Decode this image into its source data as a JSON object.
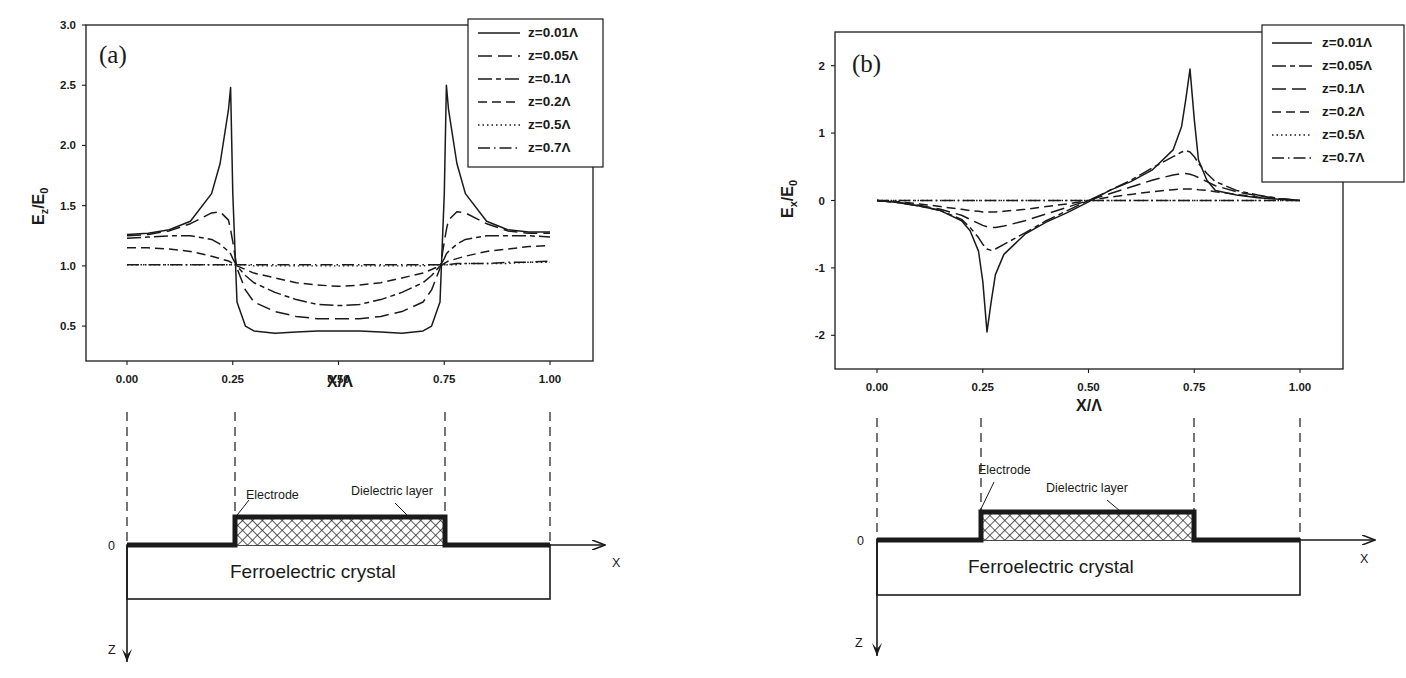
{
  "figure": {
    "panels": [
      "(a)",
      "(b)"
    ],
    "diagram": {
      "electrode_label": "Electrode",
      "dielectric_label": "Dielectric layer",
      "crystal_label": "Ferroelectric crystal",
      "origin_label": "0",
      "x_axis_label": "X",
      "z_axis_label": "Z"
    }
  },
  "chart_data": [
    {
      "type": "line",
      "panel": "(a)",
      "title": "",
      "xlabel": "X/Λ",
      "ylabel": "E_z/E_0",
      "xlim": [
        -0.1,
        1.11
      ],
      "ylim": [
        0.21,
        3.0
      ],
      "xticks": [
        "0.00",
        "0.25",
        "0.50",
        "0.75",
        "1.00"
      ],
      "yticks": [
        "0.5",
        "1.0",
        "1.5",
        "2.0",
        "2.5",
        "3.0"
      ],
      "grid": false,
      "legend_position": "top-right",
      "x": [
        0.0,
        0.05,
        0.1,
        0.15,
        0.2,
        0.22,
        0.24,
        0.245,
        0.25,
        0.26,
        0.28,
        0.3,
        0.35,
        0.4,
        0.45,
        0.5,
        0.55,
        0.6,
        0.65,
        0.7,
        0.72,
        0.74,
        0.75,
        0.755,
        0.76,
        0.78,
        0.8,
        0.85,
        0.9,
        0.95,
        1.0
      ],
      "series": [
        {
          "name": "z=0.01Λ",
          "dash": "solid",
          "values": [
            1.26,
            1.27,
            1.3,
            1.37,
            1.6,
            1.85,
            2.3,
            2.48,
            1.6,
            0.7,
            0.5,
            0.46,
            0.44,
            0.45,
            0.46,
            0.46,
            0.46,
            0.45,
            0.44,
            0.46,
            0.5,
            0.7,
            1.6,
            2.5,
            2.3,
            1.85,
            1.6,
            1.37,
            1.3,
            1.28,
            1.28
          ]
        },
        {
          "name": "z=0.05Λ",
          "dash": "long",
          "values": [
            1.25,
            1.26,
            1.29,
            1.35,
            1.44,
            1.45,
            1.38,
            1.3,
            1.2,
            0.98,
            0.8,
            0.7,
            0.62,
            0.58,
            0.56,
            0.56,
            0.56,
            0.58,
            0.62,
            0.7,
            0.8,
            0.98,
            1.2,
            1.3,
            1.38,
            1.45,
            1.44,
            1.35,
            1.29,
            1.27,
            1.27
          ]
        },
        {
          "name": "z=0.1Λ",
          "dash": "longshort",
          "values": [
            1.23,
            1.24,
            1.25,
            1.25,
            1.22,
            1.18,
            1.12,
            1.1,
            1.06,
            1.0,
            0.92,
            0.86,
            0.78,
            0.72,
            0.68,
            0.67,
            0.68,
            0.72,
            0.78,
            0.86,
            0.92,
            1.0,
            1.06,
            1.1,
            1.12,
            1.18,
            1.22,
            1.25,
            1.25,
            1.25,
            1.24
          ]
        },
        {
          "name": "z=0.2Λ",
          "dash": "medium",
          "values": [
            1.15,
            1.15,
            1.14,
            1.12,
            1.08,
            1.06,
            1.04,
            1.03,
            1.02,
            1.0,
            0.97,
            0.94,
            0.9,
            0.86,
            0.84,
            0.83,
            0.84,
            0.86,
            0.9,
            0.94,
            0.97,
            1.0,
            1.02,
            1.03,
            1.04,
            1.06,
            1.08,
            1.12,
            1.14,
            1.16,
            1.17
          ]
        },
        {
          "name": "z=0.5Λ",
          "dash": "dotted",
          "values": [
            1.01,
            1.01,
            1.01,
            1.01,
            1.01,
            1.01,
            1.01,
            1.01,
            1.01,
            1.01,
            1.01,
            1.0,
            1.0,
            1.0,
            1.0,
            1.0,
            1.0,
            1.0,
            1.0,
            1.0,
            1.01,
            1.01,
            1.01,
            1.01,
            1.01,
            1.01,
            1.02,
            1.02,
            1.02,
            1.03,
            1.03
          ]
        },
        {
          "name": "z=0.7Λ",
          "dash": "dashdot",
          "values": [
            1.01,
            1.01,
            1.01,
            1.01,
            1.01,
            1.01,
            1.01,
            1.01,
            1.01,
            1.01,
            1.01,
            1.01,
            1.01,
            1.01,
            1.01,
            1.01,
            1.01,
            1.01,
            1.01,
            1.01,
            1.01,
            1.01,
            1.01,
            1.01,
            1.01,
            1.02,
            1.02,
            1.02,
            1.03,
            1.03,
            1.04
          ]
        }
      ]
    },
    {
      "type": "line",
      "panel": "(b)",
      "title": "",
      "xlabel": "X/Λ",
      "ylabel": "E_x/E_0",
      "xlim": [
        -0.12,
        1.11
      ],
      "ylim": [
        -2.5,
        2.5
      ],
      "xticks": [
        "0.00",
        "0.25",
        "0.50",
        "0.75",
        "1.00"
      ],
      "yticks": [
        "-2",
        "-1",
        "0",
        "1",
        "2"
      ],
      "grid": false,
      "legend_position": "top-right (outside)",
      "x": [
        0.0,
        0.05,
        0.1,
        0.15,
        0.2,
        0.22,
        0.24,
        0.25,
        0.26,
        0.27,
        0.28,
        0.3,
        0.35,
        0.4,
        0.45,
        0.5,
        0.55,
        0.6,
        0.65,
        0.7,
        0.72,
        0.73,
        0.74,
        0.75,
        0.76,
        0.78,
        0.8,
        0.85,
        0.9,
        0.95,
        1.0
      ],
      "series": [
        {
          "name": "z=0.01Λ",
          "dash": "solid",
          "values": [
            0.0,
            -0.03,
            -0.08,
            -0.15,
            -0.3,
            -0.45,
            -0.75,
            -1.2,
            -1.95,
            -1.5,
            -1.1,
            -0.8,
            -0.5,
            -0.32,
            -0.18,
            -0.02,
            0.15,
            0.28,
            0.45,
            0.75,
            1.1,
            1.5,
            1.95,
            1.2,
            0.6,
            0.3,
            0.15,
            0.08,
            0.04,
            0.02,
            0.0
          ]
        },
        {
          "name": "z=0.05Λ",
          "dash": "longshort",
          "values": [
            0.0,
            -0.03,
            -0.08,
            -0.15,
            -0.28,
            -0.4,
            -0.55,
            -0.65,
            -0.72,
            -0.74,
            -0.72,
            -0.65,
            -0.48,
            -0.3,
            -0.15,
            0.0,
            0.15,
            0.3,
            0.48,
            0.65,
            0.72,
            0.74,
            0.72,
            0.65,
            0.55,
            0.4,
            0.28,
            0.15,
            0.08,
            0.03,
            0.0
          ]
        },
        {
          "name": "z=0.1Λ",
          "dash": "long",
          "values": [
            0.0,
            -0.03,
            -0.07,
            -0.13,
            -0.22,
            -0.28,
            -0.34,
            -0.37,
            -0.39,
            -0.4,
            -0.4,
            -0.38,
            -0.3,
            -0.2,
            -0.1,
            0.0,
            0.1,
            0.2,
            0.3,
            0.38,
            0.4,
            0.4,
            0.39,
            0.37,
            0.34,
            0.28,
            0.22,
            0.13,
            0.07,
            0.03,
            0.0
          ]
        },
        {
          "name": "z=0.2Λ",
          "dash": "medium",
          "values": [
            0.0,
            -0.02,
            -0.05,
            -0.09,
            -0.13,
            -0.15,
            -0.16,
            -0.17,
            -0.17,
            -0.17,
            -0.17,
            -0.16,
            -0.13,
            -0.09,
            -0.05,
            0.0,
            0.05,
            0.09,
            0.13,
            0.16,
            0.17,
            0.17,
            0.17,
            0.17,
            0.16,
            0.15,
            0.13,
            0.09,
            0.05,
            0.02,
            0.0
          ]
        },
        {
          "name": "z=0.5Λ",
          "dash": "dotted",
          "values": [
            0.0,
            0.0,
            0.0,
            0.0,
            0.0,
            0.0,
            0.0,
            0.0,
            0.0,
            0.0,
            0.0,
            0.0,
            0.0,
            0.0,
            0.0,
            0.0,
            0.0,
            0.0,
            0.0,
            0.0,
            0.0,
            0.0,
            0.0,
            0.0,
            0.0,
            0.0,
            0.0,
            0.0,
            0.0,
            0.0,
            0.0
          ]
        },
        {
          "name": "z=0.7Λ",
          "dash": "dashdot",
          "values": [
            0.0,
            0.0,
            0.0,
            0.0,
            0.0,
            0.0,
            0.0,
            0.0,
            0.0,
            0.0,
            0.0,
            0.0,
            0.0,
            0.0,
            0.0,
            0.0,
            0.0,
            0.0,
            0.0,
            0.0,
            0.0,
            0.0,
            0.0,
            0.0,
            0.0,
            0.0,
            0.0,
            0.0,
            0.0,
            0.0,
            0.0
          ]
        }
      ]
    }
  ],
  "layout": {
    "line_color": "#1a1a1a",
    "background": "#ffffff"
  }
}
